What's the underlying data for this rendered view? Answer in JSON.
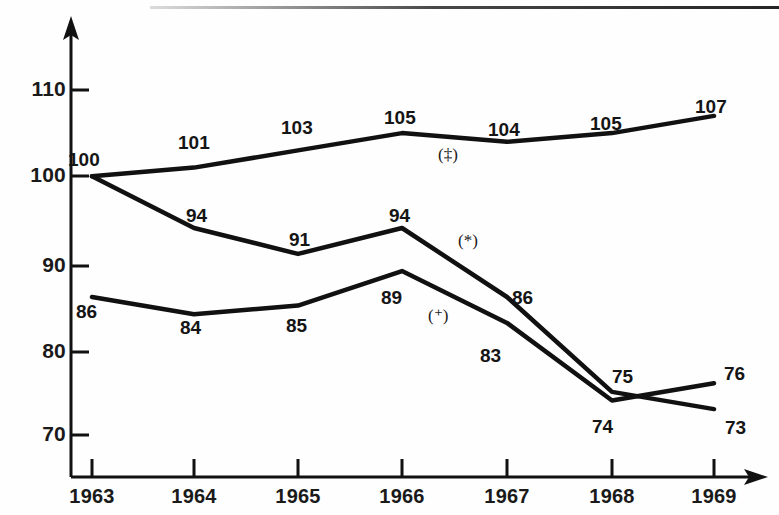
{
  "chart_data": {
    "type": "line",
    "title": "",
    "subtitle": "",
    "xlabel": "",
    "ylabel": "",
    "categories": [
      "1963",
      "1964",
      "1965",
      "1966",
      "1967",
      "1968",
      "1969"
    ],
    "x_tick_labels": [
      "1963",
      "1964",
      "1965",
      "1966",
      "1967",
      "1968",
      "1969"
    ],
    "y_tick_labels": [
      "110",
      "100",
      "90",
      "80",
      "70"
    ],
    "y_ticks": [
      110,
      100,
      90,
      80,
      70
    ],
    "ylim": [
      65,
      114
    ],
    "xlim": [
      1962.5,
      1969.6
    ],
    "grid": false,
    "legend": "inline-markers",
    "legend_position": "inline",
    "series": [
      {
        "name": "(‡)",
        "marker_label": "(‡)",
        "values": [
          100,
          101,
          103,
          105,
          104,
          105,
          107
        ],
        "data_labels": [
          "100",
          "101",
          "103",
          "105",
          "104",
          "105",
          "107"
        ]
      },
      {
        "name": "(*)",
        "marker_label": "(*)",
        "values": [
          100,
          94,
          91,
          94,
          86,
          75,
          73
        ],
        "data_labels": [
          "100",
          "94",
          "91",
          "94",
          "86",
          "75",
          "73"
        ]
      },
      {
        "name": "(⁺)",
        "marker_label": "(⁺)",
        "values": [
          86,
          84,
          85,
          89,
          83,
          74,
          76
        ],
        "data_labels": [
          "86",
          "84",
          "85",
          "89",
          "83",
          "74",
          "76"
        ]
      }
    ],
    "annotations": [
      {
        "text": "(‡)",
        "series": "(‡)",
        "near_x": "1966-1967"
      },
      {
        "text": "(*)",
        "series": "(*)",
        "near_x": "1966-1967"
      },
      {
        "text": "(⁺)",
        "series": "(⁺)",
        "near_x": "1966-1967"
      }
    ]
  },
  "axes": {
    "y_labels": [
      {
        "text": "110",
        "y": 90
      },
      {
        "text": "100",
        "y": 176
      },
      {
        "text": "90",
        "y": 266
      },
      {
        "text": "80",
        "y": 352
      },
      {
        "text": "70",
        "y": 435
      }
    ],
    "x_labels": [
      {
        "text": "1963",
        "x": 92
      },
      {
        "text": "1964",
        "x": 194
      },
      {
        "text": "1965",
        "x": 298
      },
      {
        "text": "1966",
        "x": 402
      },
      {
        "text": "1967",
        "x": 507
      },
      {
        "text": "1968",
        "x": 612
      },
      {
        "text": "1969",
        "x": 714
      }
    ]
  },
  "point_labels": {
    "top": [
      {
        "text": "100",
        "x": 68,
        "y": 149
      },
      {
        "text": "101",
        "x": 178,
        "y": 132
      },
      {
        "text": "103",
        "x": 281,
        "y": 117
      },
      {
        "text": "105",
        "x": 384,
        "y": 107
      },
      {
        "text": "104",
        "x": 488,
        "y": 119
      },
      {
        "text": "105",
        "x": 590,
        "y": 113
      },
      {
        "text": "107",
        "x": 695,
        "y": 96
      }
    ],
    "middle": [
      {
        "text": "94",
        "x": 186,
        "y": 205
      },
      {
        "text": "91",
        "x": 289,
        "y": 229
      },
      {
        "text": "94",
        "x": 389,
        "y": 205
      },
      {
        "text": "86",
        "x": 512,
        "y": 287
      },
      {
        "text": "75",
        "x": 612,
        "y": 366
      },
      {
        "text": "76",
        "x": 724,
        "y": 363
      }
    ],
    "bottom": [
      {
        "text": "86",
        "x": 76,
        "y": 301
      },
      {
        "text": "84",
        "x": 180,
        "y": 317
      },
      {
        "text": "85",
        "x": 286,
        "y": 315
      },
      {
        "text": "89",
        "x": 381,
        "y": 287
      },
      {
        "text": "83",
        "x": 480,
        "y": 345
      },
      {
        "text": "74",
        "x": 592,
        "y": 416
      },
      {
        "text": "73",
        "x": 725,
        "y": 417
      }
    ]
  },
  "markers": [
    {
      "text": "(‡)",
      "x": 438,
      "y": 145
    },
    {
      "text": "(*)",
      "x": 458,
      "y": 231
    },
    {
      "text": "(⁺)",
      "x": 428,
      "y": 305
    }
  ],
  "style": {
    "line_color": "#111111",
    "axis_color": "#111111",
    "text_color": "#151515",
    "background": "#fefefe"
  }
}
